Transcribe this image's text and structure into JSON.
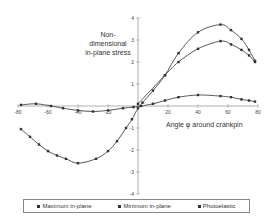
{
  "chart_data": {
    "type": "line",
    "title": "",
    "ylabel": "Non-dimensional in-plane stress",
    "xlabel": "Angle φ around crankpin",
    "xlim": [
      -80,
      80
    ],
    "ylim": [
      -4,
      4
    ],
    "xticks": [
      -80,
      -60,
      -40,
      -20,
      0,
      20,
      40,
      60,
      80
    ],
    "yticks": [
      -4,
      -3,
      -2,
      -1,
      0,
      1,
      2,
      3,
      4
    ],
    "grid": false,
    "legend_position": "bottom",
    "series": [
      {
        "name": "Maximum in-plane",
        "x": [
          -78,
          -72,
          -66,
          -60,
          -54,
          -48,
          -40,
          -28,
          -20,
          -14,
          -8,
          -4,
          0,
          3,
          10,
          18,
          27,
          40,
          55,
          62,
          69,
          74,
          78
        ],
        "values": [
          -1.05,
          -1.4,
          -1.75,
          -2.05,
          -2.25,
          -2.4,
          -2.6,
          -2.4,
          -2.05,
          -1.6,
          -1.0,
          -0.6,
          -0.1,
          0.15,
          0.7,
          1.4,
          2.4,
          3.35,
          3.7,
          3.45,
          3.05,
          2.55,
          2.05
        ]
      },
      {
        "name": "Minimum in-plane",
        "x": [
          -78,
          -68,
          -58,
          -50,
          -40,
          -30,
          -20,
          -10,
          -3,
          2,
          10,
          18,
          27,
          40,
          55,
          62,
          69,
          74,
          78
        ],
        "values": [
          0.05,
          0.1,
          0.0,
          -0.1,
          -0.2,
          -0.25,
          -0.2,
          -0.1,
          -0.05,
          0.0,
          0.1,
          0.25,
          0.4,
          0.5,
          0.45,
          0.4,
          0.3,
          0.25,
          0.2
        ]
      },
      {
        "name": "Photoelastic",
        "x": [
          0,
          18,
          27,
          40,
          55,
          62,
          69,
          74,
          78
        ],
        "values": [
          0.1,
          1.4,
          2.0,
          2.6,
          2.95,
          2.8,
          2.55,
          2.3,
          2.0
        ]
      }
    ]
  },
  "labels": {
    "ylabel_lines": [
      "Non-",
      "dimensional",
      "in-plane stress"
    ],
    "xlabel": "Angle φ around crankpin"
  },
  "legend": [
    {
      "label": "Maximum in-plane"
    },
    {
      "label": "Minimum in-plane"
    },
    {
      "label": "Photoelastic"
    }
  ]
}
